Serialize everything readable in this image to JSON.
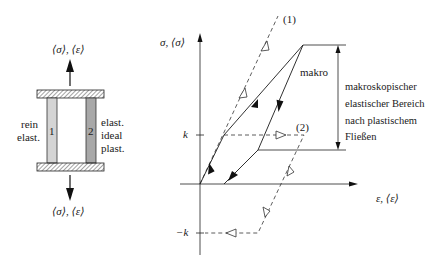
{
  "model": {
    "top_label": "⟨σ⟩, ⟨ε⟩",
    "bottom_label": "⟨σ⟩, ⟨ε⟩",
    "bar1": {
      "number": "1",
      "label_line1": "rein",
      "label_line2": "elast.",
      "color": "#d4d4d4"
    },
    "bar2": {
      "number": "2",
      "label_line1": "elast.",
      "label_line2": "ideal",
      "label_line3": "plast.",
      "color": "#a8a8a8"
    }
  },
  "graph": {
    "y_axis_label": "σ, ⟨σ⟩",
    "x_axis_label": "ε, ⟨ε⟩",
    "tick_k": "k",
    "tick_minus_k": "−k",
    "curve1_label": "(1)",
    "curve2_label": "(2)",
    "macro_label": "makro",
    "region_text": {
      "line1": "makroskopischer",
      "line2": "elastischer Bereich",
      "line3": "nach plastischem",
      "line4": "Fließen"
    }
  }
}
